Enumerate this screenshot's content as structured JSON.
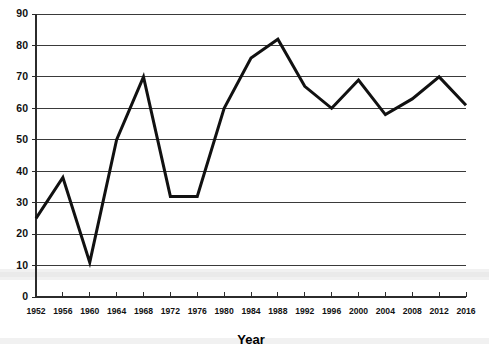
{
  "chart_data": {
    "type": "line",
    "title": "",
    "xlabel": "Year",
    "ylabel": "",
    "x": [
      1952,
      1956,
      1960,
      1964,
      1968,
      1972,
      1976,
      1980,
      1984,
      1988,
      1992,
      1996,
      2000,
      2004,
      2008,
      2012,
      2016
    ],
    "values": [
      25,
      38,
      11,
      50,
      70,
      32,
      32,
      60,
      76,
      82,
      67,
      60,
      69,
      58,
      63,
      70,
      61
    ],
    "categories": [
      "1952",
      "1956",
      "1960",
      "1964",
      "1968",
      "1972",
      "1976",
      "1980",
      "1984",
      "1988",
      "1992",
      "1996",
      "2000",
      "2004",
      "2008",
      "2012",
      "2016"
    ],
    "xtick_labels": [
      "1952",
      "1956",
      "1960",
      "1964",
      "1968",
      "1972",
      "1976",
      "1980",
      "1984",
      "1988",
      "1992",
      "1996",
      "2000",
      "2004",
      "2008",
      "2012",
      "2016"
    ],
    "ytick_labels": [
      "0",
      "10",
      "20",
      "30",
      "40",
      "50",
      "60",
      "70",
      "80",
      "90"
    ],
    "yticks": [
      0,
      10,
      20,
      30,
      40,
      50,
      60,
      70,
      80,
      90
    ],
    "ylim": [
      0,
      90
    ],
    "xlim": [
      1952,
      2016
    ],
    "grid": true,
    "grid_axis": "y",
    "legend": false,
    "legend_position": "none",
    "series": [
      {
        "name": "",
        "values": [
          25,
          38,
          11,
          50,
          70,
          32,
          32,
          60,
          76,
          82,
          67,
          60,
          69,
          58,
          63,
          70,
          61
        ],
        "color": "#111111"
      }
    ],
    "line_color": "#111111",
    "grid_color": "#3a3a3a",
    "background_color": "#ffffff"
  },
  "axes": {
    "x_title": "Year"
  }
}
